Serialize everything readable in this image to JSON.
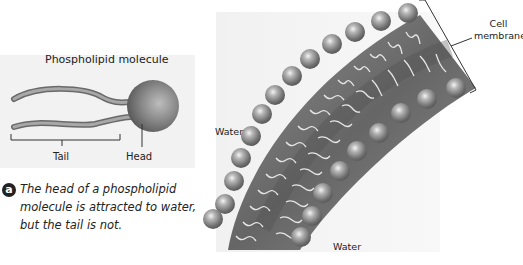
{
  "left_panel": {
    "title": "Phospholipid molecule",
    "tail_label": "Tail",
    "head_label": "Head",
    "background_color": "#f2f2f2"
  },
  "caption": {
    "badge": "a",
    "lines": [
      "The head of a phospholipid",
      "molecule is attracted to water,",
      "but the tail is not."
    ]
  },
  "membrane_panel": {
    "cell_membrane_label_line1": "Cell",
    "cell_membrane_label_line2": "membrane",
    "water_label_left": "Water",
    "water_label_bottom": "Water",
    "membrane_color": "#7a7a7a",
    "ball_color": "#8a8a8a",
    "tail_color": "#e6e6e6"
  }
}
